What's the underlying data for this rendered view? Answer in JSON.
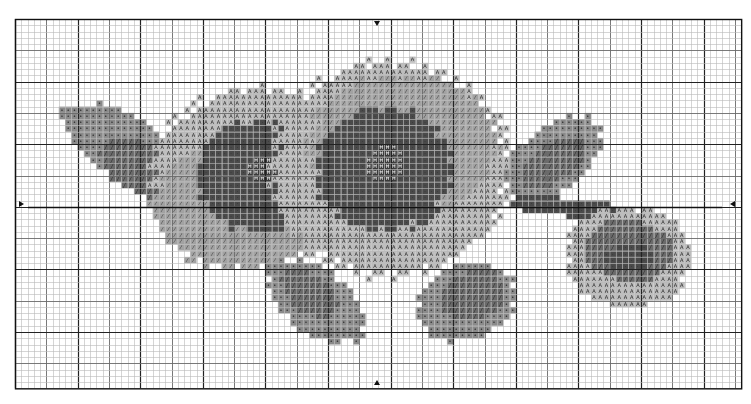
{
  "pattern": {
    "title": "Sunflower cross-stitch chart",
    "grid": {
      "left": 15,
      "top": 19,
      "cols": 116,
      "rows": 59,
      "cell": 6.26,
      "minor_color": "#b8b8b8",
      "mid_color": "#6a6a6a",
      "major_color": "#222222",
      "mid_every": 5,
      "major_every": 10,
      "center_col": 58,
      "center_row": 30
    },
    "palette": {
      "light": "#bdbdbd",
      "lightmid": "#a2a2a2",
      "mid": "#8a8a8a",
      "darkmid": "#6a6a6a",
      "dark": "#4a4a4a",
      "center": "#3a3a3a"
    },
    "symbols": {
      "light": "A",
      "lightmid": "⁄",
      "mid": "•",
      "darkmid": "╱",
      "dark": "·",
      "center": "Ħ"
    },
    "shapes": [
      {
        "name": "left-leaf",
        "tone": "mid",
        "cx": 17,
        "cy": 20,
        "rx": 9,
        "ry": 5,
        "rot": 30
      },
      {
        "name": "left-leaf-dark",
        "tone": "darkmid",
        "cx": 20,
        "cy": 24,
        "rx": 7,
        "ry": 4,
        "rot": 30
      },
      {
        "name": "left-leaf-tip",
        "tone": "mid",
        "cx": 10,
        "cy": 16,
        "rx": 3,
        "ry": 2,
        "rot": 20
      },
      {
        "name": "flower1-petals",
        "tone": "light",
        "cx": 39,
        "cy": 25,
        "rx": 17,
        "ry": 14,
        "rot": 0
      },
      {
        "name": "flower1-petals-mid",
        "tone": "lightmid",
        "cx": 36,
        "cy": 30,
        "rx": 14,
        "ry": 10,
        "rot": 0
      },
      {
        "name": "flower1-disk",
        "tone": "dark",
        "cx": 39,
        "cy": 25,
        "rx": 10,
        "ry": 9,
        "rot": 0
      },
      {
        "name": "flower1-center",
        "tone": "center",
        "cx": 40,
        "cy": 24,
        "rx": 3,
        "ry": 2,
        "rot": 0
      },
      {
        "name": "flower2-petals",
        "tone": "light",
        "cx": 60,
        "cy": 24,
        "rx": 19,
        "ry": 17,
        "rot": 0
      },
      {
        "name": "flower2-petals-mid",
        "tone": "lightmid",
        "cx": 62,
        "cy": 20,
        "rx": 15,
        "ry": 11,
        "rot": 0
      },
      {
        "name": "flower2-disk",
        "tone": "dark",
        "cx": 59,
        "cy": 24,
        "rx": 11,
        "ry": 10,
        "rot": 0
      },
      {
        "name": "flower2-center",
        "tone": "center",
        "cx": 59,
        "cy": 23,
        "rx": 3,
        "ry": 3,
        "rot": 0
      },
      {
        "name": "lower-left-leaf",
        "tone": "mid",
        "cx": 48,
        "cy": 45,
        "rx": 9,
        "ry": 5,
        "rot": 35
      },
      {
        "name": "lower-left-leaf-dark",
        "tone": "darkmid",
        "cx": 47,
        "cy": 44,
        "rx": 5,
        "ry": 3,
        "rot": 35
      },
      {
        "name": "lower-mid-leaf",
        "tone": "mid",
        "cx": 72,
        "cy": 45,
        "rx": 8,
        "ry": 6,
        "rot": -20
      },
      {
        "name": "lower-mid-leaf-dark",
        "tone": "darkmid",
        "cx": 73,
        "cy": 44,
        "rx": 5,
        "ry": 4,
        "rot": -20
      },
      {
        "name": "right-leaf",
        "tone": "mid",
        "cx": 86,
        "cy": 22,
        "rx": 9,
        "ry": 5,
        "rot": -35
      },
      {
        "name": "right-leaf-dark",
        "tone": "darkmid",
        "cx": 86,
        "cy": 23,
        "rx": 6,
        "ry": 3,
        "rot": -35
      },
      {
        "name": "stem",
        "tone": "dark",
        "cx": 88,
        "cy": 30,
        "rx": 10,
        "ry": 1.5,
        "rot": 5
      },
      {
        "name": "bud-petals",
        "tone": "light",
        "cx": 98,
        "cy": 38,
        "rx": 10,
        "ry": 8,
        "rot": 0
      },
      {
        "name": "bud-body",
        "tone": "darkmid",
        "cx": 98,
        "cy": 37,
        "rx": 7,
        "ry": 5,
        "rot": 0
      },
      {
        "name": "bud-dark",
        "tone": "dark",
        "cx": 98,
        "cy": 38,
        "rx": 4,
        "ry": 2,
        "rot": 0
      }
    ]
  }
}
